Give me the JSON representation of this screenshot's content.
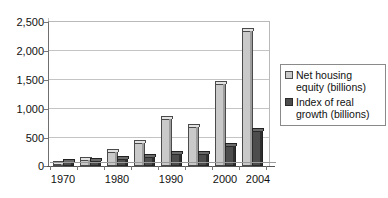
{
  "chart_data": {
    "type": "bar",
    "title": "",
    "subtitle": "",
    "xlabel": "",
    "ylabel": "",
    "ylim": [
      0,
      2500
    ],
    "yticks": [
      0,
      500,
      1000,
      1500,
      2000,
      2500
    ],
    "ytick_labels": [
      "0",
      "500",
      "1,000",
      "1,500",
      "2,000",
      "2,500"
    ],
    "grid": true,
    "legend_position": "right",
    "x": [
      1970,
      1975,
      1980,
      1985,
      1990,
      1995,
      2000,
      2004
    ],
    "categories": [
      "1970",
      "1975",
      "1980",
      "1985",
      "1990",
      "1995",
      "2000",
      "2004"
    ],
    "xtick_labels": [
      "1970",
      "1980",
      "1990",
      "2000",
      "2004"
    ],
    "xtick_values": [
      1970,
      1980,
      1990,
      2000,
      2004
    ],
    "series": [
      {
        "name": "Net housing equity (billions)",
        "color": "#c9c9c9",
        "values": [
          40,
          100,
          240,
          400,
          820,
          680,
          1430,
          2350
        ]
      },
      {
        "name": "Index of real growth (billions)",
        "color": "#4d4d4d",
        "values": [
          70,
          95,
          120,
          155,
          215,
          200,
          340,
          600
        ]
      }
    ]
  },
  "legend": {
    "entries": [
      {
        "label": "Net housing equity (billions)",
        "swatch": "light-gray-swatch"
      },
      {
        "label": "Index of real growth (billions)",
        "swatch": "dark-gray-swatch"
      }
    ]
  },
  "axes": {
    "y_tick_labels": [
      "2,500",
      "2,000",
      "1,500",
      "1,000",
      "500",
      "0"
    ],
    "x_tick_labels": [
      "1970",
      "1980",
      "1990",
      "2000",
      "2004"
    ]
  }
}
